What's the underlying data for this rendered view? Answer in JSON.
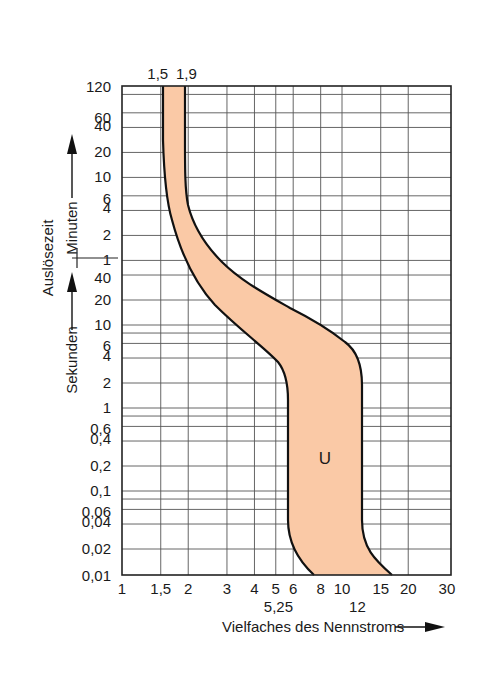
{
  "chart_data": {
    "type": "area",
    "title": "",
    "xlabel": "Vielfaches des Nennstroms",
    "ylabel": "Auslösezeit",
    "ylabel_units": {
      "upper": "Minuten",
      "lower": "Sekunden"
    },
    "x_scale": "log",
    "y_scale": "log",
    "xlim": [
      1,
      30
    ],
    "ylim_seconds": [
      0.01,
      7200
    ],
    "grid": true,
    "legend": null,
    "x_ticks": [
      "1",
      "1,5",
      "2",
      "3",
      "4",
      "5",
      "6",
      "8",
      "10",
      "15",
      "20",
      "30"
    ],
    "x_tick_values": [
      1,
      1.5,
      2,
      3,
      4,
      5,
      6,
      8,
      10,
      15,
      20,
      30
    ],
    "x_secondary_labels": [
      "5,25",
      "12"
    ],
    "x_secondary_values": [
      5.25,
      12
    ],
    "top_labels": [
      "1,5",
      "1,9"
    ],
    "top_label_values": [
      1.5,
      1.9
    ],
    "y_ticks_minutes": [
      "120",
      "60",
      "40",
      "20",
      "10",
      "6",
      "4",
      "2",
      "1"
    ],
    "y_tick_values_minutes": [
      120,
      60,
      40,
      20,
      10,
      6,
      4,
      2,
      1
    ],
    "y_ticks_seconds": [
      "40",
      "20",
      "10",
      "6",
      "4",
      "2",
      "1",
      "0,6",
      "0,4",
      "0,2",
      "0,1",
      "0,06",
      "0,04",
      "0,02",
      "0,01"
    ],
    "y_tick_values_seconds": [
      40,
      20,
      10,
      6,
      4,
      2,
      1,
      0.6,
      0.4,
      0.2,
      0.1,
      0.06,
      0.04,
      0.02,
      0.01
    ],
    "series": [
      {
        "name": "U",
        "label": "U",
        "fill_color": "#FAC9A6",
        "line_color": "#111111",
        "lower_bound": {
          "description": "minimum trip current curve",
          "points": [
            [
              1.5,
              7200
            ],
            [
              1.5,
              3600
            ],
            [
              1.52,
              600
            ],
            [
              1.6,
              180
            ],
            [
              1.75,
              60
            ],
            [
              2.0,
              35
            ],
            [
              2.6,
              18
            ],
            [
              3.6,
              9
            ],
            [
              4.6,
              5
            ],
            [
              5.1,
              3
            ],
            [
              5.25,
              2
            ],
            [
              5.25,
              1
            ],
            [
              5.25,
              0.1
            ],
            [
              5.25,
              0.03
            ],
            [
              5.8,
              0.015
            ],
            [
              7.5,
              0.01
            ]
          ]
        },
        "upper_bound": {
          "description": "maximum trip current curve",
          "points": [
            [
              1.9,
              7200
            ],
            [
              1.9,
              3600
            ],
            [
              1.95,
              600
            ],
            [
              2.2,
              240
            ],
            [
              2.8,
              120
            ],
            [
              4.2,
              60
            ],
            [
              6.5,
              30
            ],
            [
              9.0,
              15
            ],
            [
              10.8,
              8
            ],
            [
              11.8,
              4
            ],
            [
              12,
              2
            ],
            [
              12,
              1
            ],
            [
              12,
              0.1
            ],
            [
              12,
              0.02
            ],
            [
              13.5,
              0.013
            ],
            [
              16,
              0.01
            ]
          ]
        }
      }
    ],
    "colors": {
      "band_fill": "#FAC9A6",
      "outline": "#111111",
      "grid": "#555555"
    }
  }
}
